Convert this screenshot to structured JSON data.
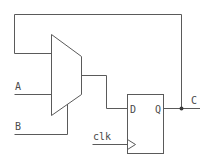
{
  "diagram": {
    "type": "circuit-schematic",
    "components": {
      "mux": {
        "name": "2-to-1 multiplexer",
        "inputs": [
          "feedback",
          "A"
        ],
        "select": "B"
      },
      "flipflop": {
        "name": "D flip-flop",
        "pins": {
          "d": "D",
          "q": "Q",
          "clock": "clk"
        }
      }
    },
    "labels": {
      "input_a": "A",
      "input_b": "B",
      "clock": "clk",
      "ff_d": "D",
      "ff_q": "Q",
      "output": "C"
    },
    "connections": [
      "Q -> C",
      "Q -> mux input 0 (feedback)",
      "A -> mux input 1",
      "B -> mux select",
      "mux output -> D",
      "clk -> flip-flop clock"
    ]
  }
}
